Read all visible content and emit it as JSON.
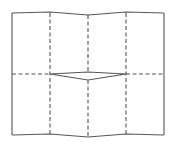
{
  "diagram": {
    "title": "",
    "line_color": "#555555",
    "background": "#ffffff",
    "vertical_folds": 3,
    "horizontal_folds": 1,
    "panels": 8
  }
}
